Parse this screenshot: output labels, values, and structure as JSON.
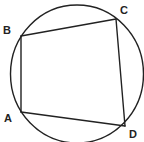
{
  "diagram": {
    "stroke_color": "#222222",
    "background": "#ffffff",
    "circle": {
      "cx": 77,
      "cy": 74,
      "rx": 66.5,
      "ry": 69
    },
    "vertices": {
      "A": {
        "label": "A",
        "x": 21,
        "y": 112,
        "label_x": 4,
        "label_y": 122
      },
      "B": {
        "label": "B",
        "x": 21,
        "y": 36,
        "label_x": 3,
        "label_y": 34
      },
      "C": {
        "label": "C",
        "x": 116,
        "y": 19,
        "label_x": 120,
        "label_y": 14
      },
      "D": {
        "label": "D",
        "x": 125,
        "y": 126,
        "label_x": 129,
        "label_y": 138
      }
    },
    "edges": [
      {
        "from": "A",
        "to": "B"
      },
      {
        "from": "B",
        "to": "C"
      },
      {
        "from": "C",
        "to": "D"
      },
      {
        "from": "D",
        "to": "A"
      }
    ]
  }
}
